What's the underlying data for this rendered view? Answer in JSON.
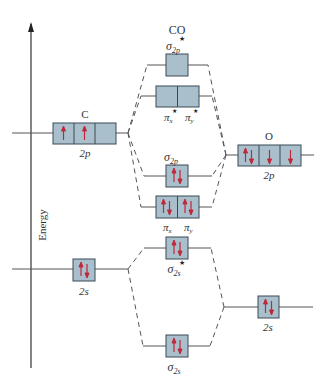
{
  "title": "CO",
  "axis": {
    "label": "Energy"
  },
  "colors": {
    "box_fill": "#a9bfcb",
    "box_stroke": "#3a4a55",
    "arrow": "#c0283c",
    "line": "#555555"
  },
  "atoms": {
    "left": {
      "symbol": "C",
      "p_label": "2p",
      "s_label": "2s",
      "p_electrons": [
        "up",
        "up",
        ""
      ],
      "s_electrons": [
        "pair"
      ]
    },
    "right": {
      "symbol": "O",
      "p_label": "2p",
      "s_label": "2s",
      "p_electrons": [
        "pair",
        "down",
        "down"
      ],
      "s_electrons": [
        "pair"
      ]
    }
  },
  "molecular_orbitals": [
    {
      "name": "sigma*2p",
      "label": "σ",
      "sub": "2p",
      "star": true,
      "electrons": [
        ""
      ]
    },
    {
      "name": "pi*2p",
      "labels": [
        "π",
        "π"
      ],
      "subs": [
        "x",
        "y"
      ],
      "star": true,
      "electrons": [
        "",
        ""
      ]
    },
    {
      "name": "sigma2p",
      "label": "σ",
      "sub": "2p",
      "star": false,
      "electrons": [
        "pair"
      ]
    },
    {
      "name": "pi2p",
      "labels": [
        "π",
        "π"
      ],
      "subs": [
        "x",
        "y"
      ],
      "star": false,
      "electrons": [
        "pair",
        "pair"
      ]
    },
    {
      "name": "sigma*2s",
      "label": "σ",
      "sub": "2s",
      "star": true,
      "electrons": [
        "pair"
      ]
    },
    {
      "name": "sigma2s",
      "label": "σ",
      "sub": "2s",
      "star": false,
      "electrons": [
        "pair"
      ]
    }
  ],
  "star_glyph": "★"
}
